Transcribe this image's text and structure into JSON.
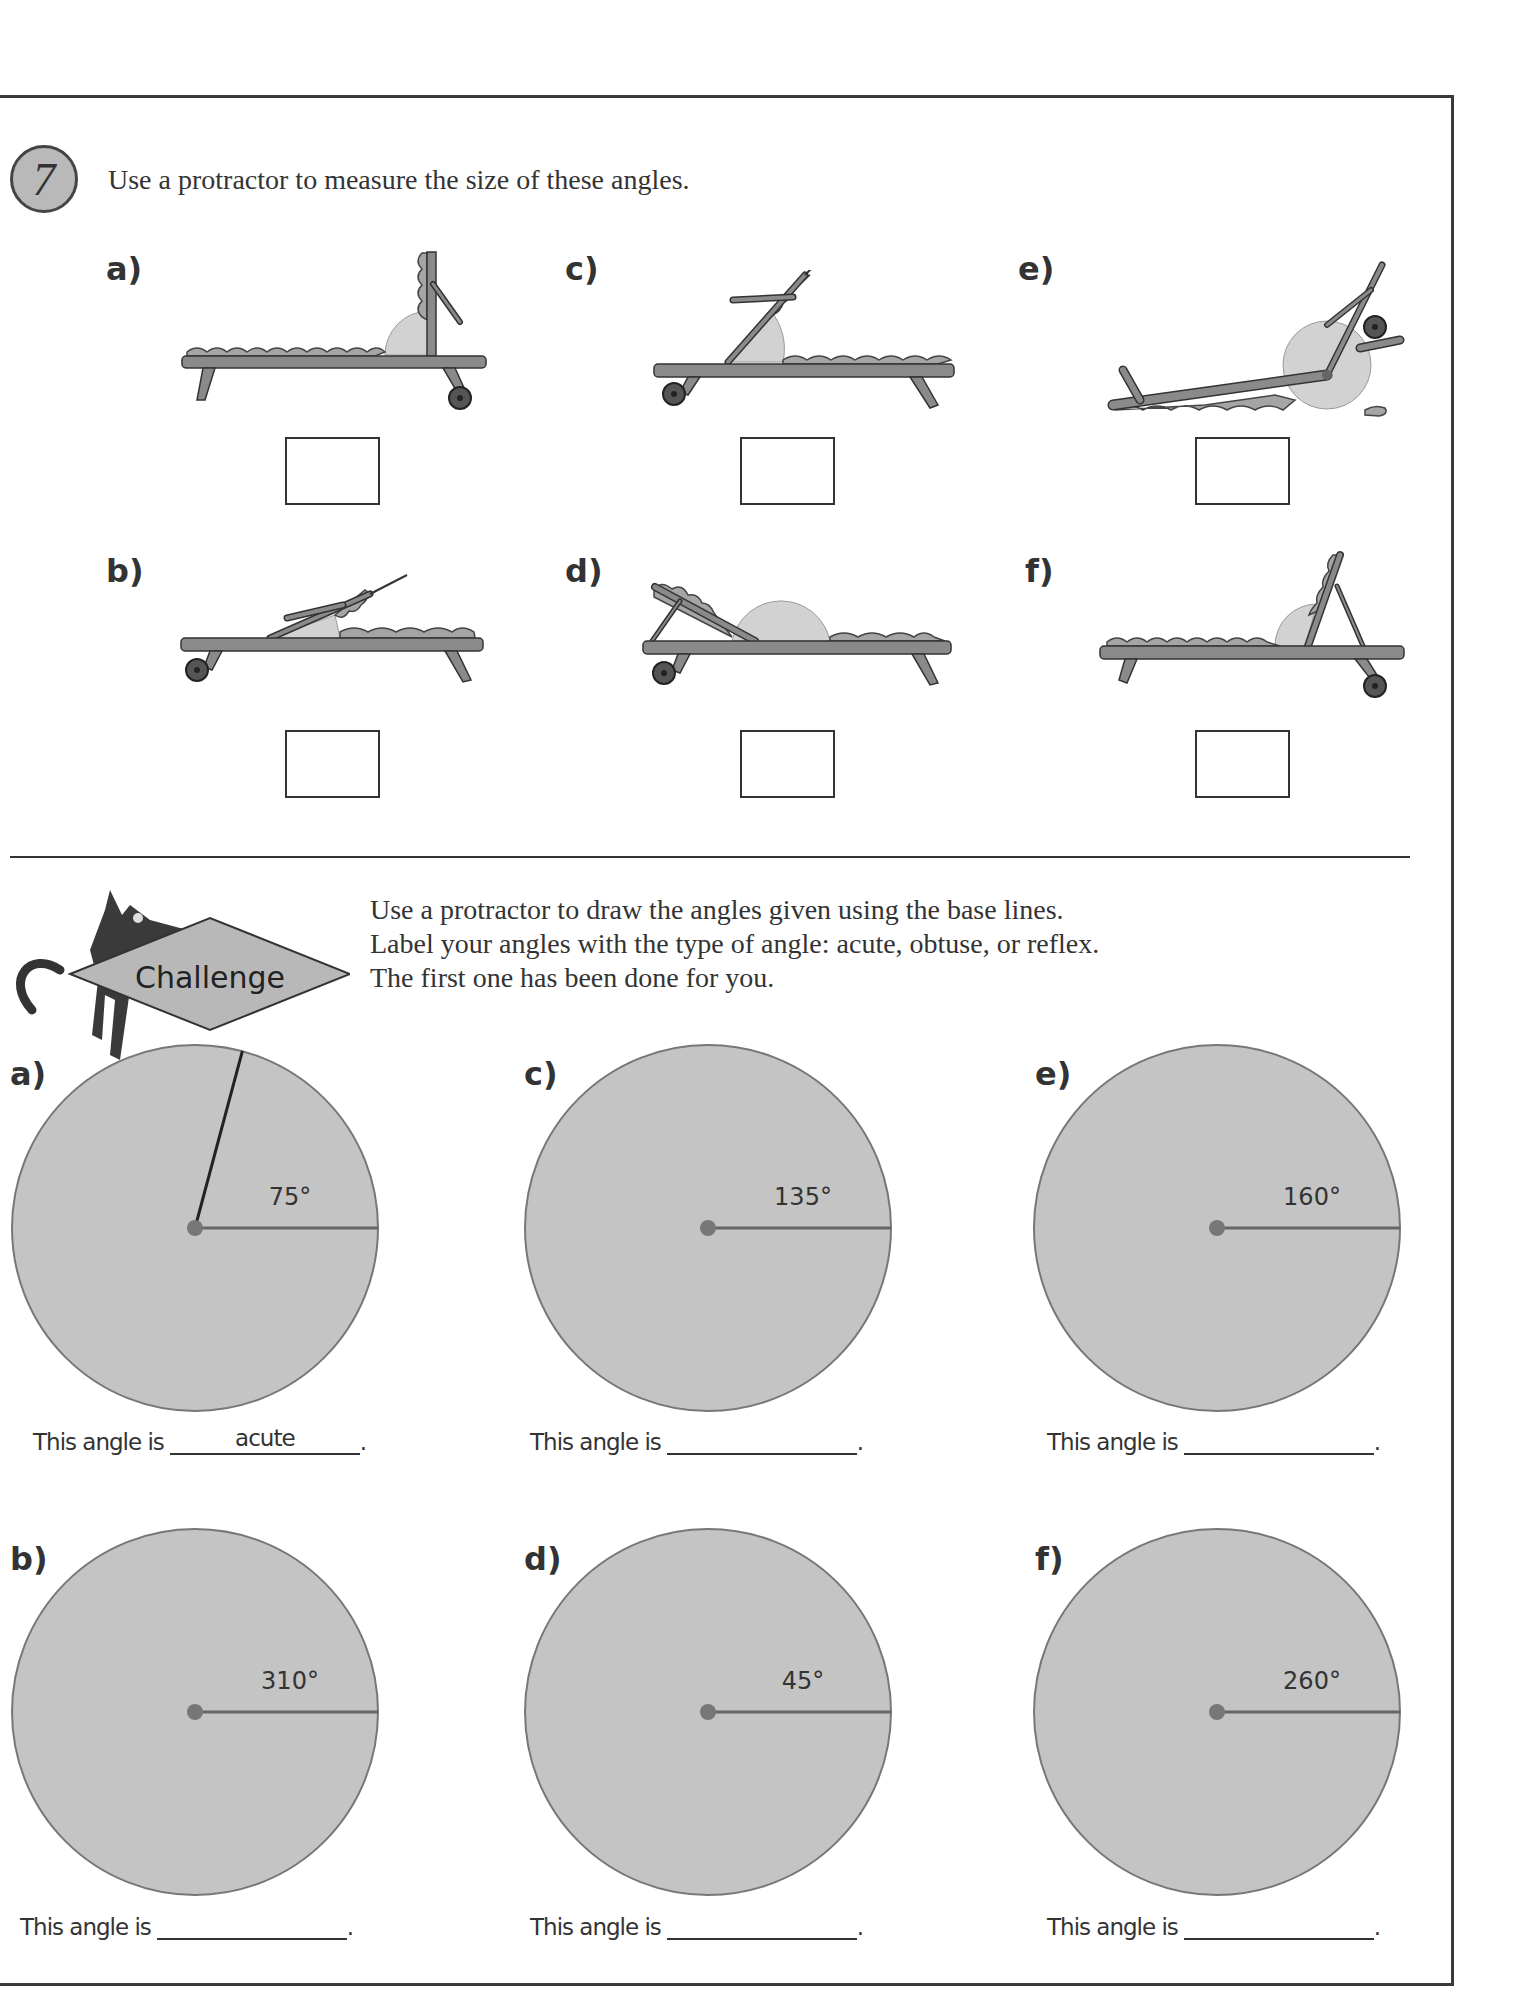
{
  "exercise": {
    "number": "7",
    "instruction": "Use a protractor to measure the size of these angles.",
    "items": [
      {
        "label": "a)",
        "answer": ""
      },
      {
        "label": "b)",
        "answer": ""
      },
      {
        "label": "c)",
        "answer": ""
      },
      {
        "label": "d)",
        "answer": ""
      },
      {
        "label": "e)",
        "answer": ""
      },
      {
        "label": "f)",
        "answer": ""
      }
    ]
  },
  "challenge": {
    "badge_label": "Challenge",
    "instructions": [
      "Use a protractor to draw the angles given using the base lines.",
      "Label your angles with the type of angle: acute, obtuse, or reflex.",
      "The first one has been done for you."
    ],
    "sentence_prefix": "This angle is",
    "sentence_suffix": ".",
    "items": [
      {
        "label": "a)",
        "angle": 75,
        "angle_text": "75°",
        "answer": "acute",
        "drawn": true
      },
      {
        "label": "b)",
        "angle": 310,
        "angle_text": "310°",
        "answer": "",
        "drawn": false
      },
      {
        "label": "c)",
        "angle": 135,
        "angle_text": "135°",
        "answer": "",
        "drawn": false
      },
      {
        "label": "d)",
        "angle": 45,
        "angle_text": "45°",
        "answer": "",
        "drawn": false
      },
      {
        "label": "e)",
        "angle": 160,
        "angle_text": "160°",
        "answer": "",
        "drawn": false
      },
      {
        "label": "f)",
        "angle": 260,
        "angle_text": "260°",
        "answer": "",
        "drawn": false
      }
    ]
  },
  "colors": {
    "circle_fill": "#c4c4c4",
    "circle_stroke": "#777777",
    "chair_wood": "#8a8a8a",
    "cushion": "#a5a5a5",
    "angle_arc": "#d2d2d2"
  }
}
